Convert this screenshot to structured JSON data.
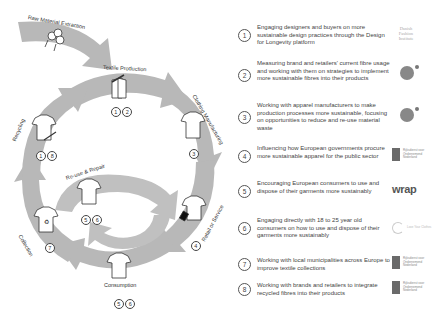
{
  "diagram": {
    "stages": [
      {
        "id": "raw",
        "label": "Raw Material Extraction",
        "icon": "cotton-icon",
        "numbers": []
      },
      {
        "id": "textile",
        "label": "Textile Production",
        "icon": "fabric-icon",
        "numbers": [
          "1",
          "2"
        ]
      },
      {
        "id": "manufacturing",
        "label": "Clothing Manufacturing",
        "icon": "tshirt-icon",
        "numbers": [
          "3"
        ]
      },
      {
        "id": "retail",
        "label": "Retail or Service",
        "icon": "tshirt-tag-icon",
        "numbers": [
          "4"
        ]
      },
      {
        "id": "consumption",
        "label": "Consumption",
        "icon": "tshirt-hanger-icon",
        "numbers": [
          "5",
          "6"
        ]
      },
      {
        "id": "collection",
        "label": "Collection",
        "icon": "tshirt-recycle-icon",
        "numbers": [
          "7"
        ]
      },
      {
        "id": "recycling",
        "label": "Recycling",
        "icon": "tshirt-shredded-icon",
        "numbers": [
          "1",
          "8"
        ]
      },
      {
        "id": "reuse",
        "label": "Re-use & Repair",
        "icon": "tshirt-repair-icon",
        "numbers": [
          "5",
          "6"
        ]
      }
    ],
    "colors": {
      "arrow": "#b5b5b5",
      "arrow_inner": "#c4c4c4",
      "icon_stroke": "#333333"
    }
  },
  "legend": {
    "items": [
      {
        "num": "1",
        "text": "Engaging designers and buyers on more sustainable design practices through the Design for Longevity platform",
        "logo": "Danish Fashion Institute"
      },
      {
        "num": "2",
        "text": "Measuring brand and retailers' current fibre usage and working with them on strategies to implement more sustainable fibres into their products",
        "logo": "face-logo"
      },
      {
        "num": "3",
        "text": "Working with apparel manufacturers to make production processes more sustainable, focusing on opportunities to reduce and re-use material waste",
        "logo": "face-logo"
      },
      {
        "num": "4",
        "text": "Influencing how European governments procure more sustainable apparel for the public sector",
        "logo": "government-logo"
      },
      {
        "num": "5",
        "text": "Encouraging European consumers to use and dispose of their garments more sustainably",
        "logo": "wrap"
      },
      {
        "num": "6",
        "text": "Engaging directly with 18 to 25 year old consumers on how to use and dispose of their garments more sustainably",
        "logo": "Love Your Clothes"
      },
      {
        "num": "7",
        "text": "Working with local municipalities across Europe to improve textile collections",
        "logo": "government-logo"
      },
      {
        "num": "8",
        "text": "Working with brands and retailers to integrate recycled fibres into their products",
        "logo": "government-logo"
      }
    ],
    "dfi_lines": [
      "Danish",
      "Fashion",
      "Institute"
    ],
    "gov_text": "Rijksdienst voor Ondernemend Nederland",
    "wrap_text": "wrap",
    "lyc_text": "Love Your Clothes"
  }
}
